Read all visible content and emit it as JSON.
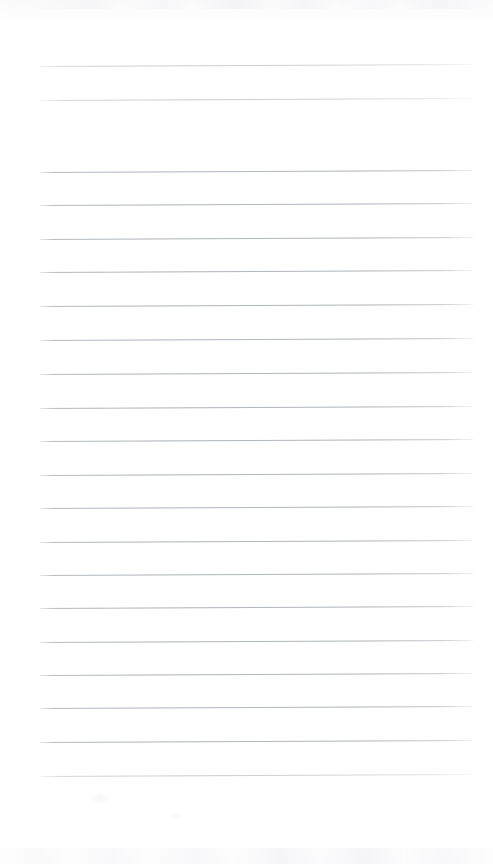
{
  "page": {
    "kind": "scanned-lined-notebook-page",
    "width": 493,
    "height": 864,
    "background_color": "#fefefe",
    "content_text": "",
    "handwriting_present": false,
    "ruling": {
      "line_color": "#aeb3b9",
      "line_thickness_px": 1,
      "line_left_x": 40,
      "line_right_x": 473,
      "line_spacing_px": 33.6,
      "first_line_y": 66,
      "skew_degrees": -0.28,
      "line_count": 30,
      "gap_after_line_index": 1,
      "blank_bottom_margin_px": 84,
      "lines": [
        {
          "y": 66,
          "weight": "soft"
        },
        {
          "y": 100,
          "weight": "soft"
        },
        {
          "y": 172,
          "weight": "normal"
        },
        {
          "y": 205,
          "weight": "normal"
        },
        {
          "y": 239,
          "weight": "normal"
        },
        {
          "y": 272,
          "weight": "normal"
        },
        {
          "y": 306,
          "weight": "normal"
        },
        {
          "y": 340,
          "weight": "normal"
        },
        {
          "y": 374,
          "weight": "normal"
        },
        {
          "y": 408,
          "weight": "normal"
        },
        {
          "y": 441,
          "weight": "normal"
        },
        {
          "y": 475,
          "weight": "normal"
        },
        {
          "y": 508,
          "weight": "normal"
        },
        {
          "y": 542,
          "weight": "normal"
        },
        {
          "y": 575,
          "weight": "normal"
        },
        {
          "y": 608,
          "weight": "normal"
        },
        {
          "y": 642,
          "weight": "normal"
        },
        {
          "y": 675,
          "weight": "normal"
        },
        {
          "y": 708,
          "weight": "normal"
        },
        {
          "y": 742,
          "weight": "normal"
        },
        {
          "y": 776,
          "weight": "soft"
        }
      ]
    }
  }
}
